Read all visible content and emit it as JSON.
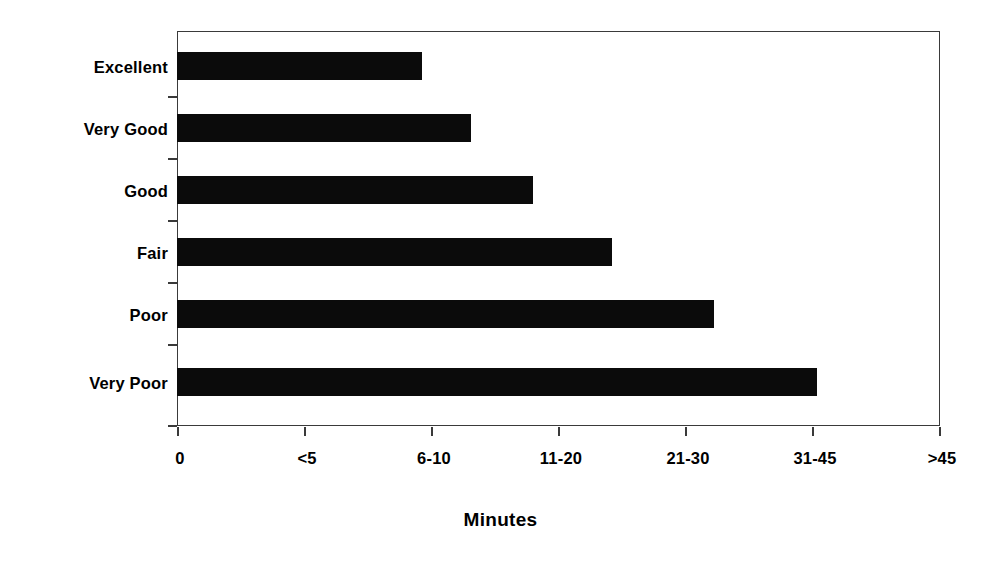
{
  "chart_data": {
    "type": "bar",
    "orientation": "horizontal",
    "title": "",
    "subtitle": "",
    "xlabel": "Minutes",
    "ylabel": "",
    "grid": false,
    "legend": false,
    "legend_position": "none",
    "bar_color": "#0b0b0b",
    "axis_color": "#3a3a3a",
    "background": "#ffffff",
    "categories": [
      "Excellent",
      "Very Good",
      "Good",
      "Fair",
      "Poor",
      "Very Poor"
    ],
    "xtick_labels": [
      "0",
      "<5",
      "6-10",
      "11-20",
      "21-30",
      "31-45",
      ">45"
    ],
    "xtick_values": [
      0,
      1,
      2,
      3,
      4,
      5,
      6
    ],
    "xlim": [
      0,
      6
    ],
    "values": [
      1.93,
      2.31,
      2.8,
      3.42,
      4.22,
      5.03
    ],
    "value_labels": [
      "6-10",
      "6-10",
      "11-20",
      "11-20",
      "21-30",
      "31-45"
    ],
    "series": [
      {
        "name": "Wait time",
        "values": [
          1.93,
          2.31,
          2.8,
          3.42,
          4.22,
          5.03
        ]
      }
    ],
    "annotations": []
  },
  "axis": {
    "x_title": "Minutes"
  }
}
